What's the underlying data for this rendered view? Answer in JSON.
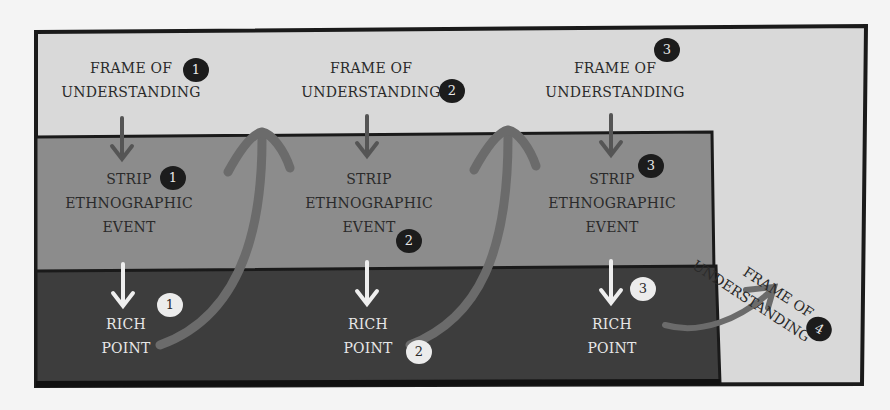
{
  "diagram": {
    "colors": {
      "frame_fill": "#d9d9d9",
      "strip_fill": "#8c8c8c",
      "rich_fill": "#3d3d3d",
      "outline": "#1a1a1a",
      "curve_arrow": "#6b6b6b",
      "down_arrow_dark": "#555555",
      "down_arrow_light": "#eeeeee"
    },
    "frames": [
      {
        "line1": "FRAME OF",
        "line2": "UNDERSTANDING",
        "badge": "1"
      },
      {
        "line1": "FRAME OF",
        "line2": "UNDERSTANDING",
        "badge": "2"
      },
      {
        "line1": "FRAME OF",
        "line2": "UNDERSTANDING",
        "badge": "3"
      },
      {
        "line1": "FRAME OF",
        "line2": "UNDERSTANDING",
        "badge": "4"
      }
    ],
    "strips": [
      {
        "line1": "STRIP",
        "line2": "ETHNOGRAPHIC",
        "line3": "EVENT",
        "badge": "1"
      },
      {
        "line1": "STRIP",
        "line2": "ETHNOGRAPHIC",
        "line3": "EVENT",
        "badge": "2"
      },
      {
        "line1": "STRIP",
        "line2": "ETHNOGRAPHIC",
        "line3": "EVENT",
        "badge": "3"
      }
    ],
    "rich_points": [
      {
        "line1": "RICH",
        "line2": "POINT",
        "badge": "1"
      },
      {
        "line1": "RICH",
        "line2": "POINT",
        "badge": "2"
      },
      {
        "line1": "RICH",
        "line2": "POINT",
        "badge": "3"
      }
    ]
  }
}
